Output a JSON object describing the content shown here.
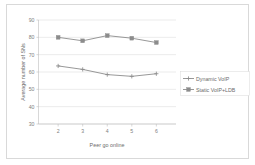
{
  "chart_data": {
    "type": "line",
    "title": "",
    "xlabel": "Peer go online",
    "ylabel": "Average number of SNs",
    "categories": [
      "2",
      "3",
      "4",
      "5",
      "6"
    ],
    "x": [
      2,
      3,
      4,
      5,
      6
    ],
    "ylim": [
      30,
      90
    ],
    "yticks": [
      30,
      40,
      50,
      60,
      70,
      80,
      90
    ],
    "ytick_labels": [
      "30",
      "40",
      "50",
      "60",
      "70",
      "80",
      "90"
    ],
    "grid": true,
    "legend_position": "right",
    "series": [
      {
        "name": "Dynamic VoIP",
        "marker": "plus",
        "color": "#8c8c8c",
        "values": [
          63.5,
          61.5,
          58.5,
          57.5,
          59.0
        ]
      },
      {
        "name": "Static VoIP+LDB",
        "marker": "square",
        "color": "#8c8c8c",
        "values": [
          80.0,
          78.0,
          81.0,
          79.5,
          77.0
        ]
      }
    ]
  },
  "figure": {
    "border_color": "#d9d9d9",
    "background": "#ffffff",
    "axis_color": "#bdbdbd",
    "grid_color": "#d6d6d6",
    "text_color": "#6b6b6b"
  }
}
